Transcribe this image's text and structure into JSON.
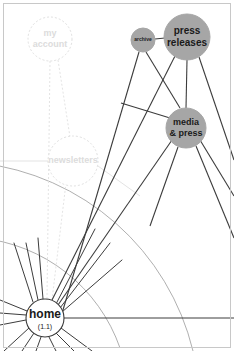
{
  "canvas": {
    "width": 234,
    "height": 351,
    "background": "#ffffff",
    "frame_color": "#c8c8c8"
  },
  "colors": {
    "node_filled": "#a6a6a6",
    "node_filled_stroke": "#a6a6a6",
    "node_outline_stroke": "#3a3a3a",
    "node_ghost_stroke": "#e0e0e0",
    "node_ghost_text": "#dcdcdc",
    "edge_dark": "#3c3c3c",
    "edge_light": "#e2e2e2",
    "arc_color": "#8f8f8f",
    "label_dark": "#1a1a1a"
  },
  "graph": {
    "title": "site map graph",
    "nodes": [
      {
        "id": "home",
        "label": "home",
        "sublabel": "(1.1)",
        "style": "outline",
        "cx": 45,
        "cy": 318,
        "r": 19,
        "font_size": 12,
        "sub_font_size": 7
      },
      {
        "id": "my-account",
        "label_line1": "my",
        "label_line2": "account",
        "style": "ghost",
        "cx": 50,
        "cy": 39,
        "r": 22,
        "font_size": 9
      },
      {
        "id": "newsletters",
        "label": "newsletters",
        "style": "ghost",
        "cx": 73,
        "cy": 161,
        "r": 25,
        "font_size": 9
      },
      {
        "id": "archive",
        "label": "archive",
        "style": "filled",
        "cx": 143,
        "cy": 40,
        "r": 12,
        "font_size": 5
      },
      {
        "id": "press-releases",
        "label_line1": "press",
        "label_line2": "releases",
        "style": "filled",
        "cx": 187,
        "cy": 37,
        "r": 23,
        "font_size": 10
      },
      {
        "id": "media-press",
        "label_line1": "media",
        "label_line2": "& press",
        "style": "filled",
        "cx": 186,
        "cy": 128,
        "r": 20,
        "font_size": 9
      }
    ],
    "edges_dark": [
      {
        "from": "archive",
        "to": "press-releases",
        "name": "edge-archive-press-releases"
      },
      {
        "from": "press-releases",
        "to": "media-press",
        "name": "edge-press-releases-media-press"
      },
      {
        "from": "archive",
        "to": "media-press",
        "name": "edge-archive-media-press"
      }
    ],
    "home_spokes": {
      "name": "home-spoke-fan",
      "count": 17,
      "description": "radial fan of dark edges emanating from the home node"
    },
    "arcs": {
      "name": "concentric-arcs",
      "count": 2,
      "description": "two faint concentric arcs centered on the home node"
    }
  },
  "legend": {
    "filled_meaning": "highlighted / selected pages",
    "ghost_meaning": "dimmed pages"
  }
}
